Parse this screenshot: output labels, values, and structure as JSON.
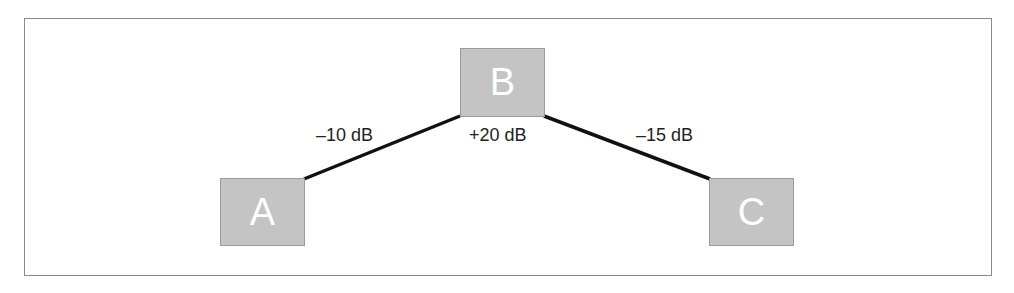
{
  "diagram": {
    "nodes": [
      {
        "id": "A",
        "label": "A"
      },
      {
        "id": "B",
        "label": "B"
      },
      {
        "id": "C",
        "label": "C"
      }
    ],
    "edges": [
      {
        "from": "A",
        "to": "B",
        "label": "–10 dB"
      },
      {
        "from": "B",
        "to": "C",
        "label": "–15 dB"
      }
    ],
    "node_gain_label": "+20 dB",
    "colors": {
      "node_fill": "#c4c4c4",
      "edge": "#111111",
      "frame": "#8a8a8a"
    }
  }
}
